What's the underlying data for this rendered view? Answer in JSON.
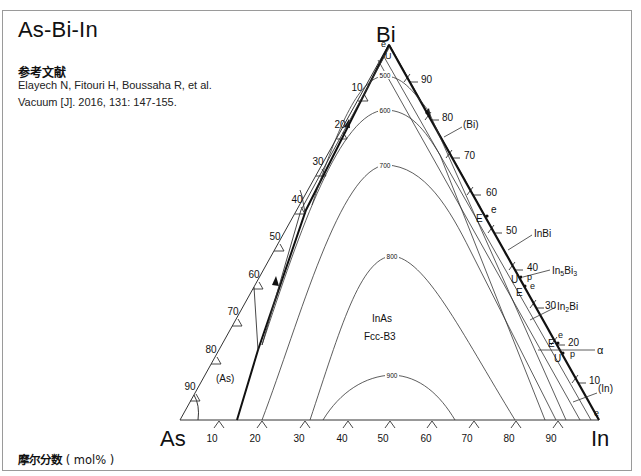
{
  "header": {
    "title": "As-Bi-In",
    "reference_heading": "参考文献",
    "reference_line1": "Elayech N, Fitouri H, Boussaha R, et al.",
    "reference_line2": "Vacuum [J]. 2016, 131: 147-155."
  },
  "footer": {
    "label_cjk": "摩尔分数",
    "label_unit": "( mol% )"
  },
  "diagram": {
    "type": "ternary-liquidus-projection",
    "vertices": {
      "left": "As",
      "top": "Bi",
      "right": "In"
    },
    "bottom_ticks": [
      "10",
      "20",
      "30",
      "40",
      "50",
      "60",
      "70",
      "80",
      "90"
    ],
    "left_ticks": [
      "10",
      "20",
      "30",
      "40",
      "50",
      "60",
      "70",
      "80",
      "90"
    ],
    "right_ticks": [
      "90",
      "80",
      "70",
      "60",
      "50",
      "40",
      "30",
      "20",
      "10"
    ],
    "isotherms": [
      "500",
      "600",
      "700",
      "800",
      "900"
    ],
    "phase_labels": {
      "as": "(As)",
      "bi": "(Bi)",
      "inbi": "InBi",
      "in5bi3_base": "In",
      "in5bi3_sub1": "5",
      "in5bi3_mid": "Bi",
      "in5bi3_sub2": "3",
      "in2bi_base": "In",
      "in2bi_sub": "2",
      "in2bi_end": "Bi",
      "alpha": "α",
      "in": "(In)",
      "inas": "InAs",
      "inas_struct": "Fcc-B3"
    },
    "invariant_points": {
      "bi_e": "e",
      "bi_u": "U",
      "e1": "e",
      "E1": "E",
      "p1": "p",
      "U1": "U",
      "e2": "e",
      "E2": "E",
      "e3": "e",
      "E3": "E",
      "p2": "p",
      "U2": "U",
      "in_e": "e"
    },
    "colors": {
      "line": "#333333",
      "heavy_line": "#111111",
      "frame": "#9a9a9a"
    }
  }
}
